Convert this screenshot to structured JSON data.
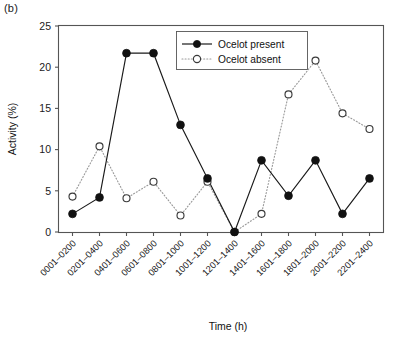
{
  "panel": {
    "label": "(b)"
  },
  "chart_data": {
    "type": "line",
    "title": "",
    "xlabel": "Time (h)",
    "ylabel": "Activity (%)",
    "categories": [
      "0001–0200",
      "0201–0400",
      "0401–0600",
      "0601–0800",
      "0801–1000",
      "1001–1200",
      "1201–1400",
      "1401–1600",
      "1601–1800",
      "1801–2000",
      "2001–2200",
      "2201–2400"
    ],
    "series": [
      {
        "name": "Ocelot present",
        "marker": "filled-circle",
        "linestyle": "solid",
        "color": "#111111",
        "values": [
          2.2,
          4.2,
          21.7,
          21.7,
          13.0,
          6.5,
          0.0,
          8.7,
          4.4,
          8.7,
          2.2,
          6.5
        ]
      },
      {
        "name": "Ocelot absent",
        "marker": "open-circle",
        "linestyle": "dotted",
        "color": "#9a9a9a",
        "values": [
          4.3,
          10.4,
          4.1,
          6.1,
          2.0,
          6.1,
          0.0,
          2.2,
          16.7,
          20.8,
          14.4,
          12.5
        ]
      }
    ],
    "ylim": [
      0,
      25
    ],
    "yticks": [
      0,
      5,
      10,
      15,
      20,
      25
    ],
    "ytick_labels": [
      "0",
      "5",
      "10",
      "15",
      "20",
      "25"
    ],
    "grid": false,
    "legend_position": "top-center"
  },
  "legend": {
    "entries": [
      {
        "label": "Ocelot present"
      },
      {
        "label": "Ocelot absent"
      }
    ]
  }
}
